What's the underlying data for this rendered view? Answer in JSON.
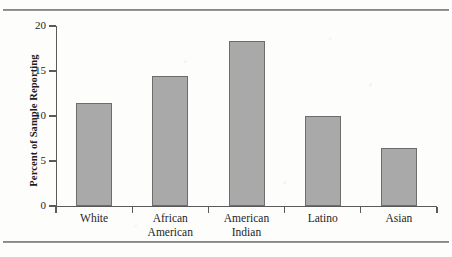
{
  "figure": {
    "top_rule": "horizontal-rule",
    "bottom_rule": "horizontal-rule"
  },
  "chart_data": {
    "type": "bar",
    "title": "",
    "xlabel": "",
    "ylabel": "Percent of Sample Reporting",
    "categories": [
      "White",
      "African American",
      "American Indian",
      "Latino",
      "Asian"
    ],
    "category_lines": [
      [
        "White"
      ],
      [
        "African",
        "American"
      ],
      [
        "American",
        "Indian"
      ],
      [
        "Latino"
      ],
      [
        "Asian"
      ]
    ],
    "values": [
      11.5,
      14.5,
      18.3,
      10.0,
      6.5
    ],
    "ylim": [
      0,
      20
    ],
    "yticks": [
      0,
      5,
      10,
      15,
      20
    ],
    "ytick_labels": [
      "0",
      "5",
      "10",
      "15",
      "20"
    ],
    "grid": false,
    "legend": false,
    "bar_color": "#a9a9a9",
    "bar_edge_color": "#6d6d6d",
    "axis_color": "#5a5a5a",
    "text_color": "#1d1d1d",
    "background": "#fdfdfc"
  }
}
